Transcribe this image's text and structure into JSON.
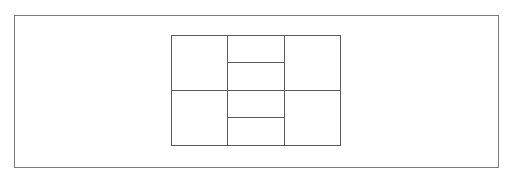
{
  "diagram": {
    "type": "grid-layout",
    "colors": {
      "background": "#ffffff",
      "outer_frame": "#7a7a7a",
      "grid_lines": "#5a5a5a"
    },
    "outer_frame": {
      "x": 14,
      "y": 15,
      "width": 485,
      "height": 153
    },
    "grid": {
      "x": 171,
      "y": 35,
      "width": 170,
      "height": 111,
      "columns": 3,
      "rows": 2,
      "column_dividers_x": [
        227,
        284
      ],
      "row_divider_y": 90,
      "middle_column_subdividers_y": [
        62,
        117
      ]
    },
    "cells": [
      {
        "id": "top-left",
        "label": ""
      },
      {
        "id": "top-middle-upper",
        "label": ""
      },
      {
        "id": "top-middle-lower",
        "label": ""
      },
      {
        "id": "top-right",
        "label": ""
      },
      {
        "id": "bottom-left",
        "label": ""
      },
      {
        "id": "bottom-middle-upper",
        "label": ""
      },
      {
        "id": "bottom-middle-lower",
        "label": ""
      },
      {
        "id": "bottom-right",
        "label": ""
      }
    ]
  }
}
